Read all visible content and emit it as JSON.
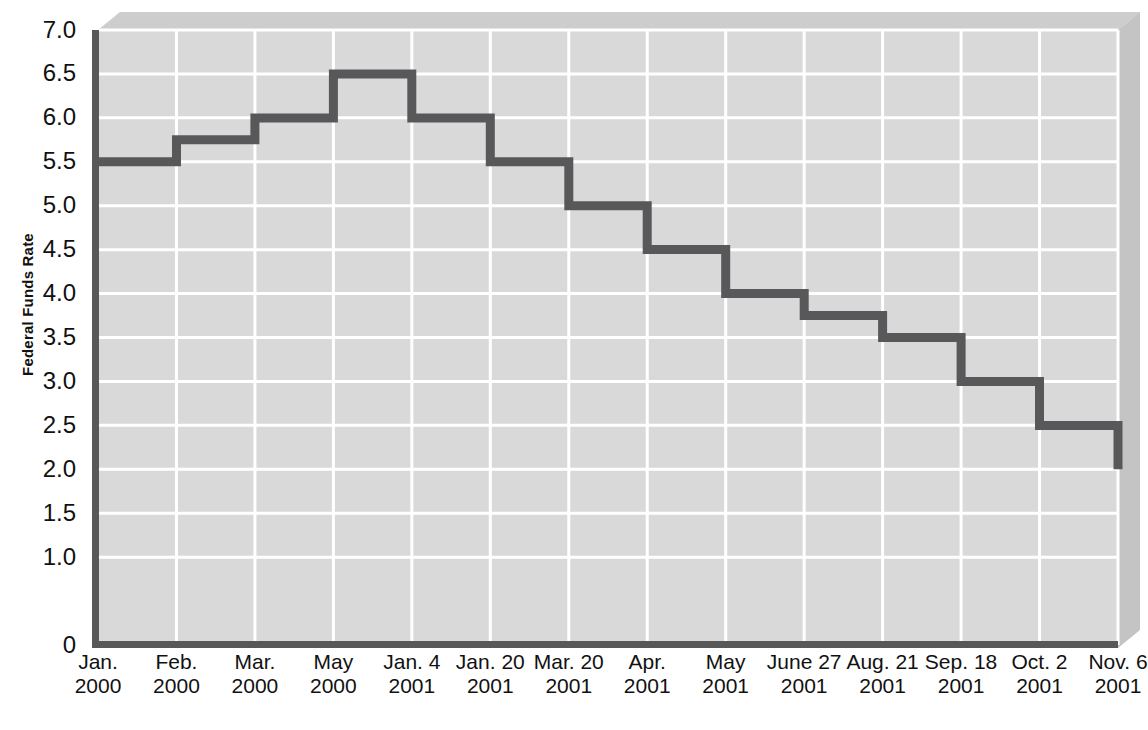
{
  "chart_data": {
    "type": "line",
    "subtype": "step",
    "title": "",
    "subtitle": "",
    "xlabel": "",
    "ylabel": "Federal Funds Rate",
    "ylim": [
      0,
      7.0
    ],
    "y_ticks": [
      0,
      1.0,
      1.5,
      2.0,
      2.5,
      3.0,
      3.5,
      4.0,
      4.5,
      5.0,
      5.5,
      6.0,
      6.5,
      7.0
    ],
    "y_tick_labels": [
      "0",
      "1.0",
      "1.5",
      "2.0",
      "2.5",
      "3.0",
      "3.5",
      "4.0",
      "4.5",
      "5.0",
      "5.5",
      "6.0",
      "6.5",
      "7.0"
    ],
    "grid": true,
    "grid_color": "#ffffff",
    "legend": "none",
    "plot_background": "#d8d8d8",
    "line_color": "#58585a",
    "categories": [
      "Jan. 2000",
      "Feb. 2000",
      "Mar. 2000",
      "May 2000",
      "Jan. 4 2001",
      "Jan. 20 2001",
      "Mar. 20 2001",
      "Apr. 2001",
      "May 2001",
      "June 27 2001",
      "Aug. 21 2001",
      "Sep. 18 2001",
      "Oct. 2 2001",
      "Nov. 6 2001"
    ],
    "values": [
      5.5,
      5.75,
      6.0,
      6.5,
      6.0,
      5.5,
      5.0,
      4.5,
      4.0,
      3.75,
      3.5,
      3.0,
      2.5,
      2.0
    ],
    "x_tick_lines": [
      {
        "l1": "Jan.",
        "l2": "2000"
      },
      {
        "l1": "Feb.",
        "l2": "2000"
      },
      {
        "l1": "Mar.",
        "l2": "2000"
      },
      {
        "l1": "May",
        "l2": "2000"
      },
      {
        "l1": "Jan. 4",
        "l2": "2001"
      },
      {
        "l1": "Jan. 20",
        "l2": "2001"
      },
      {
        "l1": "Mar. 20",
        "l2": "2001"
      },
      {
        "l1": "Apr.",
        "l2": "2001"
      },
      {
        "l1": "May",
        "l2": "2001"
      },
      {
        "l1": "June 27",
        "l2": "2001"
      },
      {
        "l1": "Aug. 21",
        "l2": "2001"
      },
      {
        "l1": "Sep. 18",
        "l2": "2001"
      },
      {
        "l1": "Oct. 2",
        "l2": "2001"
      },
      {
        "l1": "Nov. 6",
        "l2": "2001"
      }
    ]
  },
  "colors": {
    "line": "#58585a",
    "plot_fill": "#d9d9d9",
    "grid": "#ffffff",
    "axis": "#4d4d4d",
    "bevel_top": "#cfcfcf",
    "bevel_side": "#c6c6c6",
    "text": "#111111"
  }
}
